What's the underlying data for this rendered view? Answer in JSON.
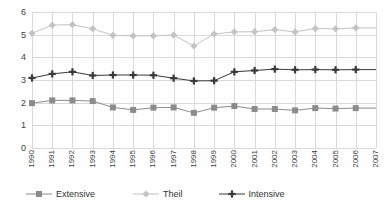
{
  "chart_data": {
    "type": "line",
    "title": "",
    "subtitle": "",
    "xlabel": "",
    "ylabel": "",
    "ylim": [
      0,
      6
    ],
    "yticks": [
      0,
      1,
      2,
      3,
      4,
      5,
      6
    ],
    "grid": true,
    "legend_position": "bottom",
    "categories": [
      "1990",
      "1991",
      "1992",
      "1993",
      "1994",
      "1995",
      "1996",
      "1997",
      "1998",
      "1999",
      "2000",
      "2001",
      "2002",
      "2003",
      "2004",
      "2005",
      "2006",
      "2007"
    ],
    "series": [
      {
        "name": "Extensive",
        "color": "#8c8c8c",
        "marker": "square",
        "values": [
          1.98,
          2.1,
          2.1,
          2.07,
          1.79,
          1.68,
          1.78,
          1.79,
          1.55,
          1.78,
          1.85,
          1.72,
          1.72,
          1.66,
          1.76,
          1.74,
          1.76,
          null
        ]
      },
      {
        "name": "Theil",
        "color": "#c3c3c3",
        "marker": "diamond",
        "values": [
          5.06,
          5.42,
          5.44,
          5.26,
          4.97,
          4.95,
          4.95,
          4.98,
          4.5,
          5.03,
          5.12,
          5.13,
          5.22,
          5.12,
          5.27,
          5.26,
          5.3,
          null
        ]
      },
      {
        "name": "Intensive",
        "color": "#3a3a3a",
        "marker": "plus",
        "values": [
          3.09,
          3.27,
          3.36,
          3.2,
          3.22,
          3.22,
          3.21,
          3.08,
          2.96,
          2.97,
          3.36,
          3.42,
          3.48,
          3.45,
          3.46,
          3.45,
          3.46,
          null
        ]
      }
    ]
  },
  "legend": {
    "items": [
      {
        "label": "Extensive"
      },
      {
        "label": "Theil"
      },
      {
        "label": "Intensive"
      }
    ]
  }
}
